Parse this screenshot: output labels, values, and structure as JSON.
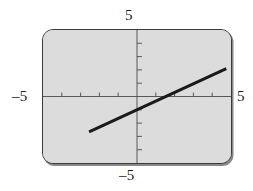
{
  "figure": {
    "kind": "graphing-calculator-screen",
    "screen_bg_color": "#d8d8d8",
    "screen_border_color": "#3a3a3a",
    "curve_color": "#1a1a1a",
    "axis_color": "#555555"
  },
  "labels": {
    "top": "5",
    "bottom": "–5",
    "left": "–5",
    "right": "5"
  },
  "chart_data": {
    "type": "line",
    "title": "",
    "xlabel": "",
    "ylabel": "",
    "xlim": [
      -5,
      5
    ],
    "ylim": [
      -5,
      5
    ],
    "grid": false,
    "legend": "none",
    "xticks": [
      -4,
      -3,
      -2,
      -1,
      1,
      2,
      3,
      4
    ],
    "yticks": [
      -4,
      -3,
      -2,
      -1,
      1,
      2,
      3,
      4
    ],
    "xtick_labels": [
      "",
      "",
      "",
      "",
      "",
      "",
      "",
      ""
    ],
    "ytick_labels": [
      "",
      "",
      "",
      "",
      "",
      "",
      "",
      ""
    ],
    "axis_end_labels": {
      "x_min": "–5",
      "x_max": "5",
      "y_min": "–5",
      "y_max": "5"
    },
    "series": [
      {
        "name": "line",
        "slope": 0.65,
        "intercept": -1.0,
        "x": [
          -2.55,
          4.75
        ],
        "y": [
          -2.66,
          2.09
        ]
      }
    ],
    "annotations": []
  }
}
